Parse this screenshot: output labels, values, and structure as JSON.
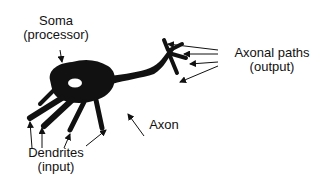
{
  "diagram": {
    "type": "neuron-illustration",
    "colors": {
      "ink": "#111111",
      "background": "#ffffff"
    },
    "labels": {
      "soma": {
        "line1": "Soma",
        "line2": "(processor)"
      },
      "axonal_paths": {
        "line1": "Axonal paths",
        "line2": "(output)"
      },
      "axon": {
        "line1": "Axon"
      },
      "dendrites": {
        "line1": "Dendrites",
        "line2": "(input)"
      }
    }
  }
}
